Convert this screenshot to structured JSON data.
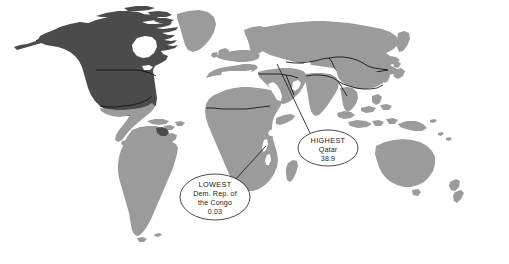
{
  "map": {
    "type": "choropleth-world-map",
    "projection": "robinson-like",
    "background_color": "#ffffff",
    "ocean_color": "#ffffff",
    "border_color": "#111111",
    "shades": {
      "dark": "#4b4b4b",
      "medium": "#9b9b9b",
      "light": "#c4c4c4"
    },
    "regions": [
      {
        "name": "United States",
        "shade": "dark"
      },
      {
        "name": "Canada",
        "shade": "dark"
      },
      {
        "name": "Alaska",
        "shade": "dark"
      },
      {
        "name": "Greenland",
        "shade": "medium"
      },
      {
        "name": "Mexico",
        "shade": "medium"
      },
      {
        "name": "Central America",
        "shade": "medium"
      },
      {
        "name": "Caribbean",
        "shade": "medium"
      },
      {
        "name": "South America",
        "shade": "medium"
      },
      {
        "name": "Suriname",
        "shade": "dark"
      },
      {
        "name": "Africa",
        "shade": "medium"
      },
      {
        "name": "Madagascar",
        "shade": "medium"
      },
      {
        "name": "Europe",
        "shade": "medium"
      },
      {
        "name": "Russia",
        "shade": "medium"
      },
      {
        "name": "Middle East",
        "shade": "medium"
      },
      {
        "name": "India",
        "shade": "medium"
      },
      {
        "name": "China",
        "shade": "medium"
      },
      {
        "name": "Southeast Asia",
        "shade": "medium"
      },
      {
        "name": "Indonesia",
        "shade": "medium"
      },
      {
        "name": "Japan",
        "shade": "medium"
      },
      {
        "name": "Australia",
        "shade": "medium"
      },
      {
        "name": "New Zealand",
        "shade": "medium"
      }
    ]
  },
  "annotations": {
    "highest": {
      "label": "HIGHEST",
      "country": "Qatar",
      "value": "38.9",
      "ellipse": {
        "cx": 328,
        "cy": 148,
        "rx": 30,
        "ry": 18
      },
      "leader_from": {
        "x": 310,
        "y": 133
      },
      "leader_to": {
        "x": 277,
        "y": 64
      }
    },
    "lowest": {
      "label": "LOWEST",
      "country_line1": "Dem. Rep. of",
      "country_line2": "the Congo",
      "value": "0.03",
      "ellipse": {
        "cx": 215,
        "cy": 197,
        "rx": 35,
        "ry": 23
      },
      "leader_from": {
        "x": 234,
        "y": 181
      },
      "leader_to": {
        "x": 266,
        "y": 146
      }
    }
  }
}
